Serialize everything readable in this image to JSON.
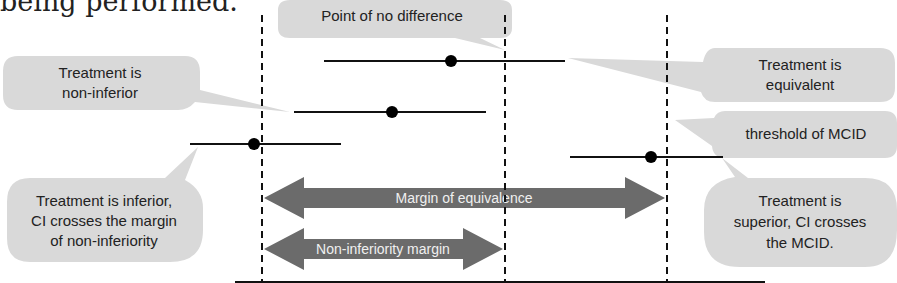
{
  "intro_text": "being performed.",
  "colors": {
    "bubble_fill": "#d9d9d9",
    "arrow_fill": "#6b6b6b",
    "line": "#111111",
    "dot": "#000000",
    "arrow_text": "#f2f2f2"
  },
  "reference_lines": [
    {
      "id": "margin-of-non-inferiority",
      "x": 262
    },
    {
      "id": "point-of-no-difference",
      "x": 505
    },
    {
      "id": "threshold-of-mcid",
      "x": 667
    }
  ],
  "confidence_intervals": [
    {
      "label": "equivalent",
      "y": 61,
      "x1": 324,
      "x2": 565,
      "point": 451
    },
    {
      "label": "non-inferior",
      "y": 112,
      "x1": 294,
      "x2": 486,
      "point": 392
    },
    {
      "label": "inferior",
      "y": 144,
      "x1": 190,
      "x2": 341,
      "point": 254
    },
    {
      "label": "superior",
      "y": 157,
      "x1": 570,
      "x2": 723,
      "point": 651
    }
  ],
  "callouts": {
    "point_of_no_difference": "Point of no difference",
    "non_inferior": [
      "Treatment is",
      "non-inferior"
    ],
    "equivalent": [
      "Treatment is",
      "equivalent"
    ],
    "threshold_mcid": "threshold of  MCID",
    "inferior": [
      "Treatment is inferior,",
      "CI crosses the margin",
      "of non-inferiority"
    ],
    "superior": [
      "Treatment is",
      "superior, CI crosses",
      "the MCID."
    ]
  },
  "arrows": {
    "equivalence": "Margin of equivalence",
    "non_inferiority": "Non-inferiority margin"
  }
}
